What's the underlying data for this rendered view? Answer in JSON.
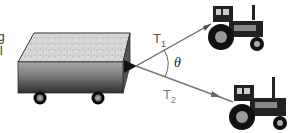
{
  "diagram": {
    "labels": {
      "t1_main": "T",
      "t1_sub": "1",
      "t2_main": "T",
      "t2_sub": "2",
      "angle": "θ"
    },
    "left_edge_fragments": [
      "g",
      "l"
    ],
    "colors": {
      "rope": "#666666",
      "wagon_top": "#cfcfcf",
      "wagon_side_top": "#9a9a9a",
      "wagon_side_bottom": "#3a3a3a",
      "tractor": "#1e1e1e"
    }
  }
}
